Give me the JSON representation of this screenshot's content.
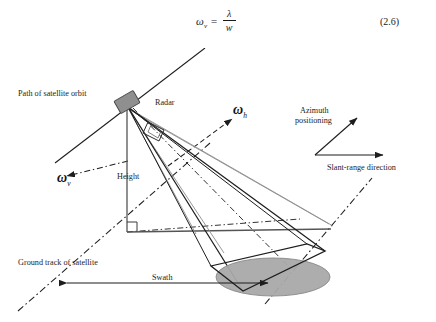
{
  "equation": {
    "lhs_symbol": "ω",
    "lhs_subscript": "v",
    "equals": "=",
    "numerator": "λ",
    "denominator": "w",
    "number": "(2.6)"
  },
  "diagram": {
    "labels": {
      "orbit_path": "Path of satellite orbit",
      "radar": "Radar",
      "height": "Height",
      "omega_v_symbol": "ω",
      "omega_v_sub": "v",
      "omega_h_symbol": "ω",
      "omega_h_sub": "h",
      "azimuth": "Azimuth\npositioning",
      "azimuth_line1": "Azimuth",
      "azimuth_line2": "positioning",
      "slant_range": "Slant-range direction",
      "ground_track": "Ground track of satellite",
      "swath": "Swath"
    },
    "colors": {
      "line": "#1d1d1d",
      "thin_line": "#6f6f6f",
      "footprint_fill": "#a9a9a9",
      "footprint_stroke": "#8a8a8a",
      "satellite_fill": "#8f8f8f",
      "satellite_stroke": "#4a4a4a",
      "background": "#ffffff"
    },
    "geometry": {
      "satellite_xy": [
        127,
        57
      ],
      "nadir_xy": [
        127,
        184
      ],
      "footprint_center": [
        273,
        229
      ],
      "footprint_rx": 57,
      "footprint_ry": 19,
      "swath_arrow_y": 235,
      "swath_arrow_x1": 67,
      "swath_arrow_x2": 268
    }
  }
}
